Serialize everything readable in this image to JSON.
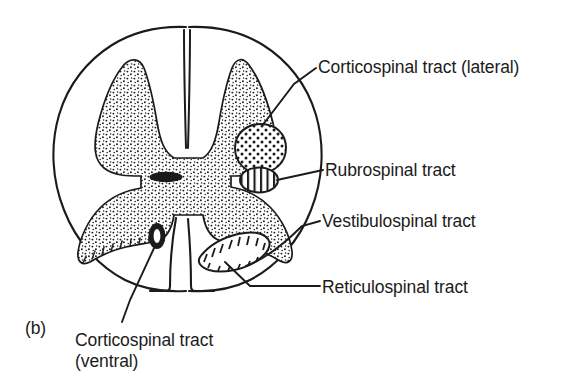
{
  "figure": {
    "panel_letter": "(b)",
    "colors": {
      "ink": "#1b1b1b",
      "background": "#ffffff",
      "gray_matter_stipple": "#1b1b1b"
    }
  },
  "labels": {
    "corticospinal_lateral": "Corticospinal tract (lateral)",
    "rubrospinal": "Rubrospinal tract",
    "vestibulospinal": "Vestibulospinal tract",
    "reticulospinal": "Reticulospinal tract",
    "corticospinal_ventral_line1": "Corticospinal tract",
    "corticospinal_ventral_line2": "(ventral)"
  },
  "structures": [
    {
      "name": "white-matter-outline",
      "description": "oval cord boundary"
    },
    {
      "name": "gray-matter-butterfly",
      "description": "stippled H-shaped gray matter"
    },
    {
      "name": "dorsal-median-sulcus",
      "description": "midline vertical cleft, dorsal"
    },
    {
      "name": "ventral-median-fissure",
      "description": "midline cleft, ventral"
    },
    {
      "name": "central-canal",
      "description": "dark lens at center of gray commissure"
    },
    {
      "name": "corticospinal-lateral-tract-marker",
      "fill": "coarse-dots"
    },
    {
      "name": "rubrospinal-tract-marker",
      "fill": "vertical-hatch"
    },
    {
      "name": "vestibulospinal-tract-marker",
      "fill": "ladder-hatch"
    },
    {
      "name": "corticospinal-ventral-tract-marker",
      "fill": "solid-dark"
    }
  ]
}
